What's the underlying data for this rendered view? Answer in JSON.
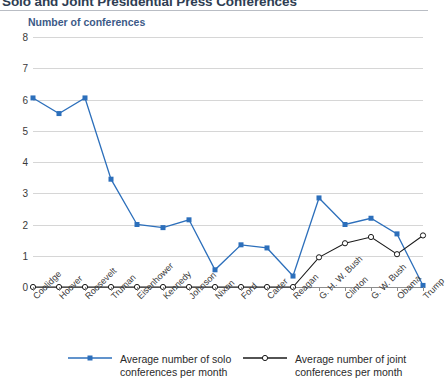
{
  "header": {
    "title": "Solo and Joint Presidential Press Conferences"
  },
  "axis": {
    "y_title": "Number of conferences"
  },
  "legend": {
    "entries": [
      {
        "name": "solo-series",
        "line1": "Average number of solo",
        "line2": "conferences per month",
        "color": "#2c6fbb",
        "marker": "filled-square"
      },
      {
        "name": "joint-series",
        "line1": "Average number of joint",
        "line2": "conferences per month",
        "color": "#1a1a1a",
        "marker": "hollow-circle"
      }
    ]
  },
  "colors": {
    "solo": "#2c6fbb",
    "joint": "#1a1a1a",
    "grid": "#d6d6d6",
    "axis": "#8d8d8d",
    "title": "#2e3d52",
    "axis_title": "#3c5a87"
  },
  "chart_data": {
    "type": "line",
    "title": "Solo and Joint Presidential Press Conferences",
    "xlabel": "",
    "ylabel": "Number of conferences",
    "ylim": [
      0,
      8
    ],
    "yticks": [
      0,
      1,
      2,
      3,
      4,
      5,
      6,
      7,
      8
    ],
    "grid": true,
    "legend_position": "bottom",
    "categories": [
      "Coolidge",
      "Hoover",
      "Roosevelt",
      "Truman",
      "Eisenhower",
      "Kennedy",
      "Johnson",
      "Nixon",
      "Ford",
      "Carter",
      "Reagan",
      "G. H. W. Bush",
      "Clinton",
      "G. W. Bush",
      "Obama",
      "Trump"
    ],
    "series": [
      {
        "name": "Average number of solo conferences per month",
        "color": "#2c6fbb",
        "values": [
          6.05,
          5.55,
          6.05,
          3.45,
          2.0,
          1.9,
          2.15,
          0.55,
          1.35,
          1.25,
          0.35,
          2.85,
          2.0,
          2.2,
          1.7,
          0.05
        ]
      },
      {
        "name": "Average number of joint conferences per month",
        "color": "#1a1a1a",
        "values": [
          0,
          0,
          0,
          0,
          0,
          0,
          0,
          0,
          0,
          0,
          0,
          0.95,
          1.4,
          1.6,
          1.05,
          1.65
        ]
      }
    ]
  }
}
